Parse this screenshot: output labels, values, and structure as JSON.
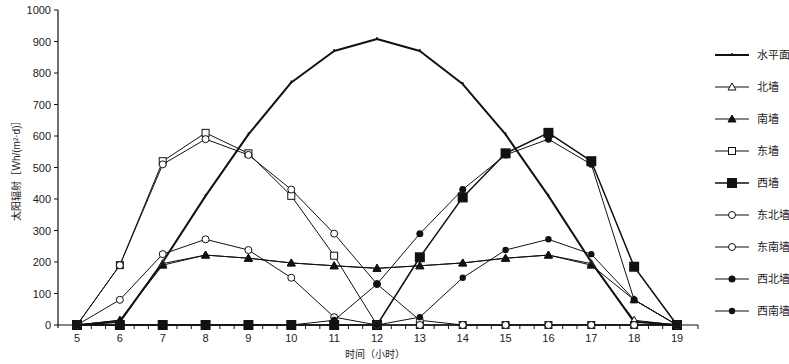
{
  "chart_data": {
    "type": "line",
    "title": "",
    "xlabel": "时间（小时）",
    "ylabel": "太阳辐射［Wh/(m²·d)］",
    "x": [
      5,
      6,
      7,
      8,
      9,
      10,
      11,
      12,
      13,
      14,
      15,
      16,
      17,
      18,
      19
    ],
    "xlim": [
      5,
      19
    ],
    "ylim": [
      0,
      1000
    ],
    "yticks": [
      0,
      100,
      200,
      300,
      400,
      500,
      600,
      700,
      800,
      900,
      1000
    ],
    "grid": false,
    "legend_position": "right",
    "series": [
      {
        "name": "水平面",
        "marker": "tick",
        "line_width": 2,
        "values": [
          0,
          10,
          200,
          410,
          605,
          770,
          870,
          908,
          870,
          765,
          605,
          410,
          200,
          10,
          0
        ]
      },
      {
        "name": "北墙",
        "marker": "triangle-open",
        "line_width": 1,
        "values": [
          0,
          15,
          195,
          222,
          212,
          197,
          188,
          180,
          188,
          197,
          212,
          222,
          195,
          15,
          0
        ]
      },
      {
        "name": "南墙",
        "marker": "triangle-filled",
        "line_width": 1,
        "values": [
          0,
          15,
          190,
          222,
          212,
          197,
          188,
          180,
          188,
          197,
          212,
          222,
          190,
          80,
          0
        ]
      },
      {
        "name": "东墙",
        "marker": "square-open",
        "line_width": 1,
        "values": [
          0,
          190,
          520,
          610,
          545,
          410,
          220,
          0,
          0,
          0,
          0,
          0,
          0,
          0,
          0
        ]
      },
      {
        "name": "西墙",
        "marker": "square-filled",
        "line_width": 1.5,
        "values": [
          0,
          0,
          0,
          0,
          0,
          0,
          0,
          0,
          215,
          405,
          545,
          610,
          520,
          185,
          0
        ]
      },
      {
        "name": "东北墙",
        "marker": "diamond-open",
        "line_width": 1,
        "values": [
          0,
          190,
          510,
          590,
          540,
          430,
          290,
          130,
          15,
          0,
          0,
          0,
          0,
          0,
          0
        ]
      },
      {
        "name": "东南墙",
        "marker": "diamond-open",
        "line_width": 1,
        "values": [
          0,
          80,
          225,
          272,
          238,
          150,
          25,
          0,
          0,
          0,
          0,
          0,
          0,
          0,
          0
        ]
      },
      {
        "name": "西北墙",
        "marker": "diamond-filled",
        "line_width": 1,
        "values": [
          0,
          0,
          0,
          0,
          0,
          0,
          15,
          130,
          290,
          430,
          540,
          590,
          510,
          80,
          0
        ]
      },
      {
        "name": "西南墙",
        "marker": "circle-filled",
        "line_width": 1,
        "values": [
          0,
          0,
          0,
          0,
          0,
          0,
          0,
          0,
          25,
          150,
          238,
          272,
          225,
          80,
          0
        ]
      }
    ]
  }
}
